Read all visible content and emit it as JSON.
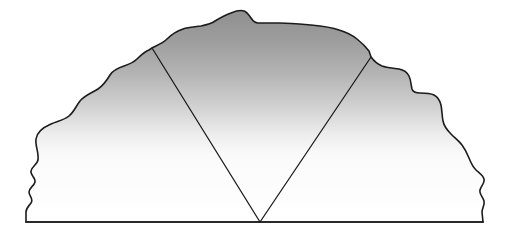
{
  "figure": {
    "type": "line-art-diagram",
    "canvas": {
      "width": 515,
      "height": 237
    },
    "background_color": "#ffffff"
  },
  "style": {
    "outline_color": "#1c1c1c",
    "outline_width": 1.6,
    "wedge_line_color": "#1c1c1c",
    "wedge_line_width": 1.3,
    "baseline_color": "#1c1c1c",
    "baseline_width": 1.6,
    "gradient_top_color": "#949494",
    "gradient_mid_color": "#c9c9c9",
    "gradient_bottom_color": "#ffffff",
    "gradient_stops": [
      {
        "offset": "0%",
        "color": "#8f8f8f"
      },
      {
        "offset": "14%",
        "color": "#9d9d9d"
      },
      {
        "offset": "30%",
        "color": "#b4b4b4"
      },
      {
        "offset": "46%",
        "color": "#d2d2d2"
      },
      {
        "offset": "58%",
        "color": "#ececec"
      },
      {
        "offset": "68%",
        "color": "#fafafa"
      },
      {
        "offset": "100%",
        "color": "#ffffff"
      }
    ]
  },
  "shapes": {
    "silhouette": {
      "name": "mountain-silhouette",
      "description": "Rough jagged hill profile rising from a flat baseline, peak left of center",
      "path": "M 26 222 L 26 212 C 26 208 29 206 31 203 C 34 199 29 196 29 192 C 29 188 34 186 35 182 C 36 178 30 175 31 171 C 32 166 37 165 38 160 C 39 152 35 146 36 139 C 37 131 44 127 51 124 C 58 121 64 120 69 116 C 74 112 76 106 80 101 C 85 95 92 93 98 89 C 104 85 107 80 110 75 C 113 70 118 68 124 66 C 130 64 134 62 137 59 C 141 55 144 52 149 50 L 152 48 C 158 45 163 43 167 39 C 172 34 177 31 183 29 C 189 27 195 27 201 26 C 206 25 211 24 215 21 C 220 18 225 15 231 13 C 236 11 241 10 244 11 C 247 12 249 15 251 18 C 253 21 255 23 258 23 C 264 23 272 23 280 23 C 290 23 300 24 311 25 C 322 26 331 27 339 30 C 346 32 352 35 357 39 C 362 43 366 47 369 51 L 371 57 C 374 61 377 64 382 66 C 388 68 394 68 399 69 C 404 70 407 72 409 76 C 411 80 411 85 412 89 C 413 92 416 93 420 93 C 425 93 430 93 434 95 C 438 97 440 101 441 105 C 442 110 442 116 443 121 C 444 126 447 130 451 134 C 455 138 459 141 462 145 C 465 149 467 153 469 158 C 471 163 473 167 476 170 C 479 173 483 175 484 179 C 485 183 481 186 480 190 C 479 194 483 197 484 201 C 485 205 482 208 482 212 L 483 222 Z"
    },
    "wedge": {
      "name": "v-wedge",
      "description": "Two straight lines converging at the baseline center forming a V",
      "apex": {
        "x": 260,
        "y": 222
      },
      "left_arm": {
        "x1": 152,
        "y1": 48,
        "x2": 260,
        "y2": 222
      },
      "right_arm": {
        "x1": 371,
        "y1": 57,
        "x2": 260,
        "y2": 222
      }
    },
    "baseline": {
      "name": "ground-baseline",
      "x1": 26,
      "y1": 222,
      "x2": 483,
      "y2": 222
    }
  }
}
